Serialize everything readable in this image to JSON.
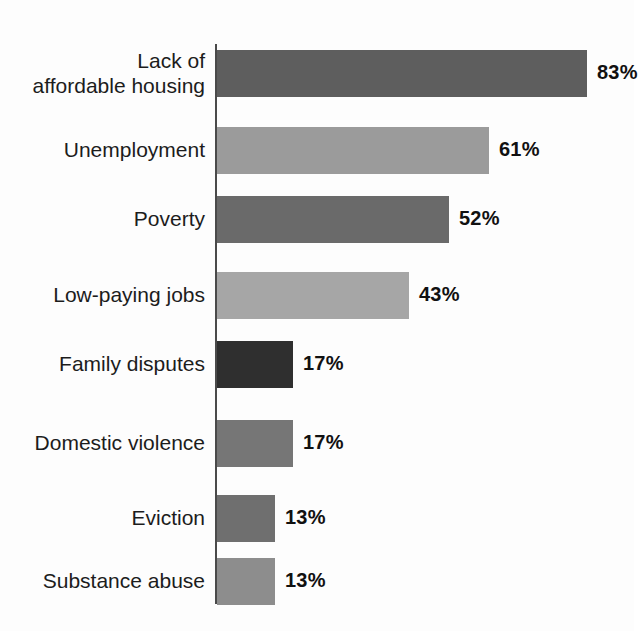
{
  "chart_data": {
    "type": "bar",
    "orientation": "horizontal",
    "title": "",
    "subtitle": "",
    "xlabel": "",
    "ylabel": "",
    "xlim": [
      0,
      100
    ],
    "grid": false,
    "legend": false,
    "value_suffix": "%",
    "categories": [
      "Lack of\naffordable housing",
      "Unemployment",
      "Poverty",
      "Low-paying jobs",
      "Family disputes",
      "Domestic violence",
      "Eviction",
      "Substance abuse"
    ],
    "values": [
      83,
      61,
      52,
      43,
      17,
      17,
      13,
      13
    ],
    "value_labels": [
      "83%",
      "61%",
      "52%",
      "43%",
      "17%",
      "17%",
      "13%",
      "13%"
    ],
    "bar_colors": [
      "#5e5e5e",
      "#9b9b9b",
      "#6a6a6a",
      "#a6a6a6",
      "#2f2f2f",
      "#767676",
      "#6f6f6f",
      "#8d8d8d"
    ],
    "axis_color": "#4a4a4a",
    "background_color": "#fdfdfd",
    "text_color": "#1c1c1c"
  },
  "bars": [
    {
      "label": "Lack of\naffordable housing",
      "value": 83,
      "value_label": "83%",
      "color": "#5e5e5e",
      "top": 50,
      "height": 47
    },
    {
      "label": "Unemployment",
      "value": 61,
      "value_label": "61%",
      "color": "#9b9b9b",
      "top": 127,
      "height": 47
    },
    {
      "label": "Poverty",
      "value": 52,
      "value_label": "52%",
      "color": "#6a6a6a",
      "top": 196,
      "height": 47
    },
    {
      "label": "Low-paying jobs",
      "value": 43,
      "value_label": "43%",
      "color": "#a6a6a6",
      "top": 272,
      "height": 47
    },
    {
      "label": "Family disputes",
      "value": 17,
      "value_label": "17%",
      "color": "#2f2f2f",
      "top": 341,
      "height": 47
    },
    {
      "label": "Domestic violence",
      "value": 17,
      "value_label": "17%",
      "color": "#767676",
      "top": 420,
      "height": 47
    },
    {
      "label": "Eviction",
      "value": 13,
      "value_label": "13%",
      "color": "#6f6f6f",
      "top": 495,
      "height": 47
    },
    {
      "label": "Substance abuse",
      "value": 13,
      "value_label": "13%",
      "color": "#8d8d8d",
      "top": 558,
      "height": 47
    }
  ]
}
